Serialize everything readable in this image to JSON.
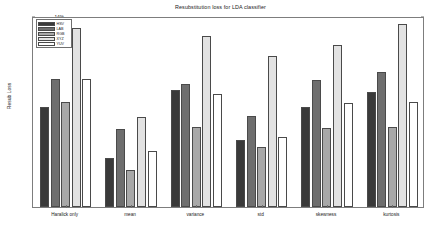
{
  "chart_data": {
    "type": "bar",
    "title": "Resubstitution loss for LDA classifier",
    "xlabel": "",
    "ylabel": "Resub Loss",
    "categories": [
      "Haralick only",
      "mean",
      "variance",
      "std",
      "skewness",
      "kurtosis"
    ],
    "series": [
      {
        "name": "HSV",
        "color": "#3a3a3a",
        "values": [
          7.3,
          3.6,
          8.6,
          4.9,
          7.3,
          8.4
        ]
      },
      {
        "name": "LAB",
        "color": "#6e6e6e",
        "values": [
          9.4,
          5.7,
          9.0,
          6.7,
          9.3,
          9.9
        ]
      },
      {
        "name": "RGB",
        "color": "#a8a8a8",
        "values": [
          7.7,
          2.7,
          5.9,
          4.4,
          5.8,
          5.9
        ]
      },
      {
        "name": "XYZ",
        "color": "#e2e2e2",
        "values": [
          13.1,
          6.6,
          12.5,
          11.1,
          11.9,
          13.4
        ]
      },
      {
        "name": "YUV",
        "color": "#ffffff",
        "values": [
          9.4,
          4.1,
          8.3,
          5.1,
          7.6,
          7.7
        ]
      }
    ],
    "ylim": [
      0,
      14
    ],
    "yticks": [
      2,
      4,
      6,
      8,
      10,
      12,
      14
    ],
    "ytick_labels": [
      "2%",
      "4%",
      "6%",
      "8%",
      "10%",
      "12%",
      "14%"
    ],
    "grid": false,
    "legend_position": "top-left"
  }
}
